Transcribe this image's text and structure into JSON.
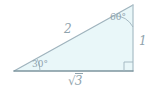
{
  "figure": {
    "type": "geometry-diagram",
    "canvas": {
      "width": 153,
      "height": 95
    },
    "colors": {
      "fill": "#e9f7f9",
      "stroke": "#9fb3bd",
      "base_stroke": "#7d959f",
      "label_text": "#8fa3ad",
      "background": "#ffffff"
    },
    "vertices": {
      "bottom_left": {
        "x": 14,
        "y": 71
      },
      "bottom_right": {
        "x": 133,
        "y": 71
      },
      "top_right": {
        "x": 133,
        "y": 5
      }
    },
    "sides": {
      "hypotenuse_label": "2",
      "vertical_label": "1",
      "base_radical_sign": "√",
      "base_radicand": "3",
      "base_label": "√3"
    },
    "angles": {
      "bottom_left_label": "30°",
      "top_right_label": "60°",
      "bottom_right_label": "90°",
      "bottom_right_marker": "right-angle-square"
    }
  }
}
